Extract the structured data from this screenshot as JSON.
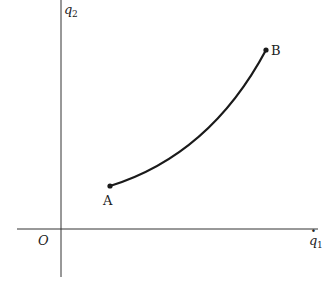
{
  "diagram": {
    "axes": {
      "y_label": "q",
      "y_label_sub": "2",
      "x_label": "q",
      "x_label_sub": "1",
      "x_label_dot": "·",
      "origin_label": "O"
    },
    "points": [
      {
        "label": "A",
        "x": 110,
        "y": 186
      },
      {
        "label": "B",
        "x": 266,
        "y": 50
      }
    ],
    "curve": {
      "from": "A",
      "to": "B",
      "shape": "convex-upward arc"
    },
    "colors": {
      "line": "#1a1a1a",
      "axis": "#333333",
      "background": "#ffffff"
    }
  }
}
